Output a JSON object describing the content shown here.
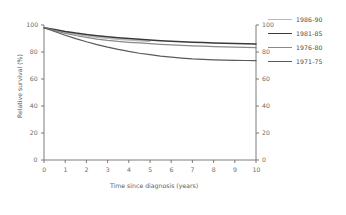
{
  "chart_data": {
    "type": "line",
    "title": "",
    "xlabel": "Time since diagnosis (years)",
    "ylabel": "Relative survival (%)",
    "xlim": [
      0,
      10
    ],
    "ylim": [
      0,
      100
    ],
    "xticks": [
      "0",
      "1",
      "2",
      "3",
      "4",
      "5",
      "6",
      "7",
      "8",
      "9",
      "10"
    ],
    "yticks": [
      "0",
      "20",
      "40",
      "60",
      "80",
      "100"
    ],
    "yticks_right": [
      "0",
      "20",
      "40",
      "60",
      "80",
      "100"
    ],
    "grid": false,
    "legend_position": "right",
    "x": [
      0,
      0.5,
      1,
      1.5,
      2,
      2.5,
      3,
      3.5,
      4,
      4.5,
      5,
      5.5,
      6,
      6.5,
      7,
      7.5,
      8,
      8.5,
      9,
      9.5,
      10
    ],
    "series": [
      {
        "name": "1986-90",
        "color": "#b9b9b9",
        "width": 1.5,
        "values": [
          98.0,
          96.3,
          94.6,
          93.2,
          92.0,
          91.0,
          90.1,
          89.4,
          88.8,
          88.3,
          87.9,
          null,
          null,
          null,
          null,
          null,
          null,
          null,
          null,
          null,
          null
        ]
      },
      {
        "name": "1981-85",
        "color": "#3a3a3a",
        "width": 1.5,
        "values": [
          98.0,
          96.6,
          95.2,
          94.0,
          93.0,
          92.1,
          91.3,
          90.6,
          90.0,
          89.4,
          88.9,
          88.4,
          88.0,
          87.6,
          87.3,
          87.0,
          86.7,
          86.5,
          86.3,
          86.1,
          86.0
        ]
      },
      {
        "name": "1976-80",
        "color": "#8a8a8a",
        "width": 1.2,
        "values": [
          98.0,
          95.8,
          93.8,
          92.2,
          90.8,
          89.6,
          88.6,
          87.8,
          87.2,
          86.7,
          86.2,
          85.7,
          85.3,
          84.9,
          84.6,
          84.3,
          84.0,
          83.8,
          83.6,
          83.4,
          83.2
        ]
      },
      {
        "name": "1971-75",
        "color": "#5a5a5a",
        "width": 1.2,
        "values": [
          98.0,
          95.2,
          92.4,
          89.9,
          87.6,
          85.5,
          83.6,
          81.9,
          80.4,
          79.1,
          78.0,
          77.0,
          76.2,
          75.5,
          74.9,
          74.5,
          74.2,
          74.0,
          73.8,
          73.7,
          73.6
        ]
      }
    ]
  },
  "legend": {
    "items": [
      {
        "label": "1986-90"
      },
      {
        "label": "1981-85"
      },
      {
        "label": "1976-80"
      },
      {
        "label": "1971-75"
      }
    ]
  }
}
